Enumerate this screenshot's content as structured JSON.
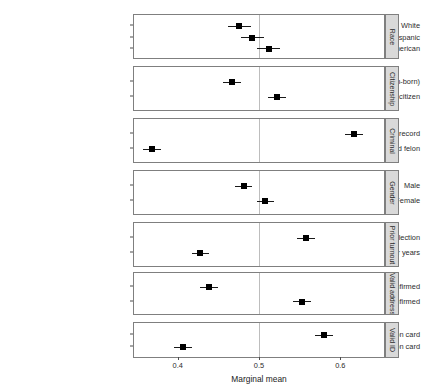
{
  "chart_data": {
    "type": "scatter",
    "title": "",
    "xlabel": "Marginal mean",
    "ylabel": "",
    "xlim": [
      0.345,
      0.655
    ],
    "xticks": [
      0.4,
      0.5,
      0.6
    ],
    "xticklabels": [
      "0.4",
      "0.5",
      "0.6"
    ],
    "grid": false,
    "legend": null,
    "reference_line": 0.5,
    "orientation": "horizontal",
    "panel_label_position": "right",
    "panels": [
      {
        "label": "Race",
        "points": [
          {
            "label": "White",
            "value": 0.476,
            "ci_low": 0.462,
            "ci_high": 0.49
          },
          {
            "label": "Hispanic",
            "value": 0.492,
            "ci_low": 0.478,
            "ci_high": 0.506
          },
          {
            "label": "African American",
            "value": 0.512,
            "ci_low": 0.498,
            "ci_high": 0.526
          }
        ]
      },
      {
        "label": "Citizenship",
        "points": [
          {
            "label": "US citizen (foreign-born)",
            "value": 0.467,
            "ci_low": 0.456,
            "ci_high": 0.478
          },
          {
            "label": "US citizen",
            "value": 0.522,
            "ci_low": 0.511,
            "ci_high": 0.533
          }
        ]
      },
      {
        "label": "Criminal",
        "points": [
          {
            "label": "No criminal record",
            "value": 0.617,
            "ci_low": 0.606,
            "ci_high": 0.628
          },
          {
            "label": "Is a convicted felon",
            "value": 0.368,
            "ci_low": 0.357,
            "ci_high": 0.379
          }
        ]
      },
      {
        "label": "Gender",
        "points": [
          {
            "label": "Male",
            "value": 0.481,
            "ci_low": 0.47,
            "ci_high": 0.492
          },
          {
            "label": "Female",
            "value": 0.508,
            "ci_low": 0.497,
            "ci_high": 0.519
          }
        ]
      },
      {
        "label": "Prior turnout",
        "points": [
          {
            "label": "Voted in the last election",
            "value": 0.558,
            "ci_low": 0.547,
            "ci_high": 0.569
          },
          {
            "label": "Has not voted in the past four years",
            "value": 0.428,
            "ci_low": 0.417,
            "ci_high": 0.439
          }
        ]
      },
      {
        "label": "Valid address",
        "points": [
          {
            "label": "Address unconfirmed",
            "value": 0.438,
            "ci_low": 0.427,
            "ci_high": 0.449
          },
          {
            "label": "Address confirmed",
            "value": 0.553,
            "ci_low": 0.542,
            "ci_high": 0.564
          }
        ]
      },
      {
        "label": "Valid ID",
        "points": [
          {
            "label": "Has state identification card",
            "value": 0.58,
            "ci_low": 0.569,
            "ci_high": 0.591
          },
          {
            "label": "Does not have state identification card",
            "value": 0.407,
            "ci_low": 0.396,
            "ci_high": 0.418
          }
        ]
      }
    ]
  },
  "colors": {
    "point": "#000000",
    "interval": "#1a1a1a",
    "panel_border": "#7f7f7f",
    "strip_fill": "#d9d9d9",
    "reference_line": "#bdbdbd",
    "background": "#ffffff",
    "text": "#2b2b2b"
  }
}
